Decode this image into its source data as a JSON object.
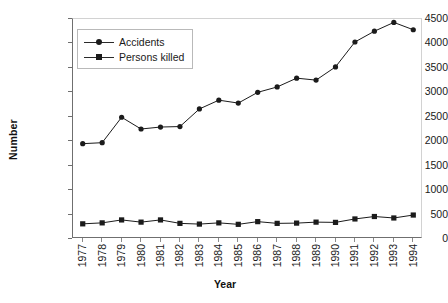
{
  "chart_data": {
    "type": "line",
    "title": "",
    "xlabel": "Year",
    "ylabel": "Number",
    "categories": [
      "1977",
      "1978",
      "1979",
      "1980",
      "1981",
      "1982",
      "1983",
      "1984",
      "1985",
      "1986",
      "1987",
      "1988",
      "1989",
      "1990",
      "1991",
      "1992",
      "1993",
      "1994"
    ],
    "series": [
      {
        "name": "Accidents",
        "marker": "circle",
        "color": "#1b1b1b",
        "values": [
          1950,
          1970,
          2490,
          2250,
          2290,
          2300,
          2660,
          2840,
          2780,
          3000,
          3110,
          3290,
          3250,
          3520,
          4030,
          4250,
          4430,
          4280
        ]
      },
      {
        "name": "Persons killed",
        "marker": "square",
        "color": "#1b1b1b",
        "values": [
          310,
          330,
          390,
          345,
          390,
          320,
          305,
          330,
          300,
          355,
          320,
          325,
          345,
          340,
          410,
          460,
          430,
          490
        ]
      }
    ],
    "ylim": [
      0,
      4500
    ],
    "yticks": [
      0,
      500,
      1000,
      1500,
      2000,
      2500,
      3000,
      3500,
      4000,
      4500
    ],
    "ytick_labels": [
      "0",
      "500",
      "1000",
      "1500",
      "2000",
      "2500",
      "3000",
      "3500",
      "4000",
      "4500"
    ],
    "grid": false,
    "legend_position": "top-left",
    "legend_entries": [
      "Accidents",
      "Persons killed"
    ]
  },
  "axes": {
    "y_title": "Number",
    "x_title": "Year"
  },
  "legend": {
    "items": [
      {
        "label": "Accidents",
        "marker": "circle-marker"
      },
      {
        "label": "Persons killed",
        "marker": "square-marker"
      }
    ]
  }
}
